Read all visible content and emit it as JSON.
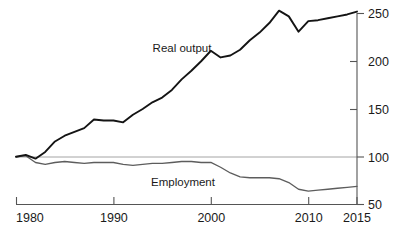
{
  "chart_data": {
    "type": "line",
    "title": "",
    "subtitle": "",
    "xlabel": "",
    "ylabel": "",
    "xlim": [
      1980,
      2015
    ],
    "ylim": [
      50,
      260
    ],
    "y_axis_position": "right",
    "grid": false,
    "gridlines": [
      100
    ],
    "legend": "inline-annotations",
    "x_ticks": [
      1980,
      1990,
      2000,
      2010,
      2015
    ],
    "x_tick_labels": [
      "1980",
      "1990",
      "2000",
      "2010",
      "2015"
    ],
    "y_ticks": [
      50,
      100,
      150,
      200,
      250
    ],
    "y_tick_labels": [
      "50",
      "100",
      "150",
      "200",
      "250"
    ],
    "annotations": [
      {
        "text": "Real output",
        "x": 1994,
        "y": 192
      },
      {
        "text": "Employment",
        "x": 1994,
        "y": 72
      }
    ],
    "series": [
      {
        "name": "Real output",
        "color": "#141414",
        "x": [
          1980,
          1981,
          1982,
          1983,
          1984,
          1985,
          1986,
          1987,
          1988,
          1989,
          1990,
          1991,
          1992,
          1993,
          1994,
          1995,
          1996,
          1997,
          1998,
          1999,
          2000,
          2001,
          2002,
          2003,
          2004,
          2005,
          2006,
          2007,
          2008,
          2009,
          2010,
          2011,
          2012,
          2013,
          2014,
          2015
        ],
        "values": [
          100,
          102,
          98,
          105,
          116,
          122,
          126,
          130,
          139,
          138,
          138,
          136,
          144,
          150,
          157,
          162,
          170,
          181,
          190,
          200,
          211,
          204,
          206,
          212,
          222,
          230,
          240,
          253,
          247,
          231,
          242,
          243,
          245,
          247,
          249,
          252
        ]
      },
      {
        "name": "Employment",
        "color": "#5d5d5d",
        "x": [
          1980,
          1981,
          1982,
          1983,
          1984,
          1985,
          1986,
          1987,
          1988,
          1989,
          1990,
          1991,
          1992,
          1993,
          1994,
          1995,
          1996,
          1997,
          1998,
          1999,
          2000,
          2001,
          2002,
          2003,
          2004,
          2005,
          2006,
          2007,
          2008,
          2009,
          2010,
          2011,
          2012,
          2013,
          2014,
          2015
        ],
        "values": [
          100,
          101,
          94,
          92,
          94,
          95,
          94,
          93,
          94,
          94,
          94,
          92,
          91,
          92,
          93,
          93,
          94,
          95,
          95,
          94,
          94,
          89,
          83,
          79,
          78,
          78,
          78,
          77,
          73,
          66,
          64,
          65,
          66,
          67,
          68,
          69
        ]
      }
    ]
  }
}
